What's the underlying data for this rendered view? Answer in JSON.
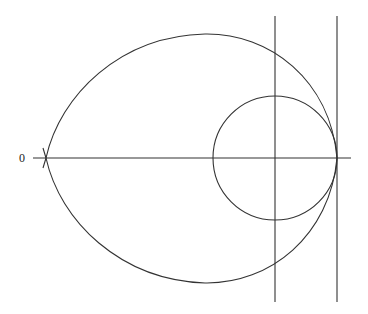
{
  "diagram": {
    "origin_label": "0",
    "stroke_color": "#333333",
    "background": "#ffffff",
    "elements": {
      "horizontal_axis": {
        "x1": 33,
        "x2": 351,
        "y": 158
      },
      "vertical_line_left": {
        "x": 275,
        "y1": 16,
        "y2": 302
      },
      "vertical_line_right": {
        "x": 337,
        "y1": 16,
        "y2": 302
      },
      "inner_circle": {
        "cx": 275,
        "cy": 158,
        "r": 62
      },
      "outer_curve": {
        "left_point": [
          46,
          158
        ],
        "right_tangent_point": [
          337,
          158
        ],
        "top_y": 34,
        "bottom_y": 283
      }
    }
  }
}
